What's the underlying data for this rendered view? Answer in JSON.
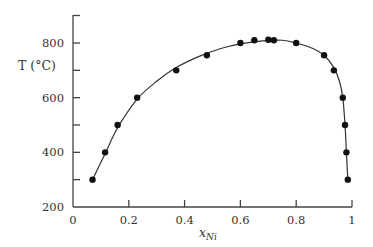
{
  "chart_data": {
    "type": "scatter",
    "title": "",
    "xlabel": "x_Ni",
    "xlabel_main": "x",
    "xlabel_sub": "Ni",
    "ylabel": "T (°C)",
    "xlim": [
      0,
      1
    ],
    "ylim": [
      200,
      900
    ],
    "xticks": [
      0,
      0.2,
      0.4,
      0.6,
      0.8,
      1
    ],
    "xtick_labels": [
      "0",
      "0.2",
      "0.4",
      "0.6",
      "0.8",
      "1"
    ],
    "yticks": [
      200,
      300,
      400,
      500,
      600,
      700,
      800
    ],
    "ytick_labels": [
      "200",
      "",
      "400",
      "",
      "600",
      "",
      "800"
    ],
    "grid": false,
    "legend": null,
    "series": [
      {
        "name": "measured points",
        "style": "markers",
        "x": [
          0.07,
          0.115,
          0.16,
          0.23,
          0.37,
          0.48,
          0.6,
          0.65,
          0.7,
          0.72,
          0.8,
          0.9,
          0.935,
          0.967,
          0.975,
          0.98,
          0.985
        ],
        "y": [
          300,
          400,
          500,
          600,
          700,
          755,
          800,
          810,
          812,
          810,
          800,
          755,
          700,
          600,
          500,
          400,
          300
        ]
      },
      {
        "name": "fitted curve",
        "style": "line",
        "x": [
          0.07,
          0.115,
          0.16,
          0.23,
          0.3,
          0.37,
          0.45,
          0.53,
          0.6,
          0.68,
          0.75,
          0.8,
          0.86,
          0.9,
          0.935,
          0.955,
          0.967,
          0.975,
          0.98,
          0.985
        ],
        "y": [
          300,
          395,
          490,
          595,
          660,
          710,
          750,
          780,
          797,
          808,
          810,
          800,
          780,
          755,
          710,
          660,
          600,
          500,
          400,
          300
        ]
      }
    ]
  }
}
